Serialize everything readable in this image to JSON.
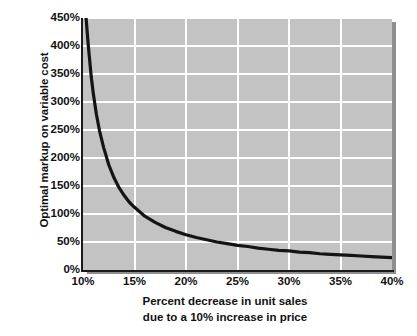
{
  "chart_data": {
    "type": "line",
    "title": "",
    "subtitle": "",
    "xlabel_line1": "Percent decrease in unit sales",
    "xlabel_line2": "due to a 10% increase in price",
    "ylabel": "Optimal markup on variable cost",
    "xlim": [
      10,
      40
    ],
    "ylim": [
      0,
      450
    ],
    "xtick_values": [
      10,
      15,
      20,
      25,
      30,
      35,
      40
    ],
    "xtick_labels": [
      "10%",
      "15%",
      "20%",
      "25%",
      "30%",
      "35%",
      "40%"
    ],
    "ytick_values": [
      0,
      50,
      100,
      150,
      200,
      250,
      300,
      350,
      400,
      450
    ],
    "ytick_labels": [
      "0%",
      "50%",
      "100%",
      "150%",
      "200%",
      "250%",
      "300%",
      "350%",
      "400%",
      "450%"
    ],
    "grid": true,
    "grid_color": "#ffffff",
    "plot_background": "#c3c3c3",
    "page_background": "#ffffff",
    "line_color": "#141414",
    "line_width": 3.2,
    "legend": null,
    "legend_position": "none",
    "annotations": [],
    "series": [
      {
        "name": "Optimal markup on variable cost",
        "x": [
          10.3,
          10.5,
          10.8,
          11.0,
          11.3,
          11.6,
          12.0,
          12.5,
          13.0,
          13.5,
          14.0,
          14.5,
          15.0,
          16.0,
          17.0,
          18.0,
          19.0,
          20.0,
          21.0,
          22.0,
          23.0,
          24.0,
          25.0,
          26.0,
          27.0,
          28.0,
          29.0,
          30.0,
          31.0,
          32.0,
          33.0,
          34.0,
          35.0,
          36.0,
          37.0,
          38.0,
          39.0,
          40.0
        ],
        "y": [
          450,
          404,
          345,
          315,
          278,
          249,
          219,
          188,
          165,
          147,
          133,
          121,
          112,
          96,
          85,
          76,
          69,
          63,
          58,
          54,
          50,
          47,
          44,
          42,
          39,
          37,
          35,
          34,
          32,
          31,
          29,
          28,
          27,
          26,
          25,
          24,
          23,
          22
        ]
      }
    ]
  }
}
